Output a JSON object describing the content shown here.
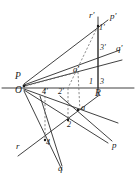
{
  "figure": {
    "width": 138,
    "height": 181,
    "background": "#ffffff",
    "stroke_color": "#2b2b2b",
    "dashed_color": "#6b6b6b"
  },
  "labels": {
    "P": "P",
    "O": "O",
    "R": "R",
    "a": "a",
    "a_prime": "a'",
    "one": "1",
    "one_prime": "1'",
    "two": "2",
    "two_prime": "2'",
    "three": "3",
    "three_prime": "3'",
    "four": "4",
    "four_prime": "4'",
    "p": "p",
    "p_prime": "p'",
    "q": "q",
    "q_prime": "q'",
    "r": "r",
    "r_prime": "r'"
  },
  "geometry": {
    "points": {
      "P": [
        24,
        80
      ],
      "O": [
        24,
        88
      ],
      "R": [
        98,
        88
      ],
      "a": [
        80,
        112
      ],
      "a_prime": [
        74,
        72
      ],
      "one": [
        98,
        26
      ],
      "two": [
        68,
        120
      ],
      "three": [
        98,
        88
      ],
      "four": [
        45,
        140
      ],
      "two_prime": [
        68,
        88
      ],
      "four_prime": [
        45,
        88
      ]
    },
    "axis": {
      "y_horizontal": 88,
      "x_left": 2,
      "x_right": 134,
      "vertical_x": 98,
      "vertical_top": 18,
      "vertical_bottom": 96
    }
  }
}
